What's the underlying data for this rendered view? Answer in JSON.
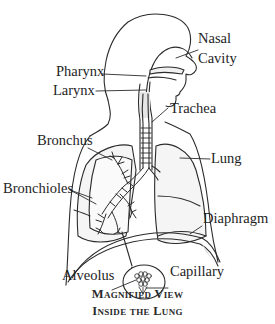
{
  "diagram": {
    "labels": {
      "nasal_cavity_line1": "Nasal",
      "nasal_cavity_line2": "Cavity",
      "pharynx": "Pharynx",
      "larynx": "Larynx",
      "trachea": "Trachea",
      "bronchus": "Bronchus",
      "lung": "Lung",
      "bronchioles": "Bronchioles",
      "diaphragm": "Diaphragm",
      "alveolus": "Alveolus",
      "capillary": "Capillary"
    },
    "caption": {
      "line1": "Magnified View",
      "line2": "Inside the Lung"
    },
    "colors": {
      "line": "#2b2b2b",
      "fill_shade": "#ececec",
      "background": "#ffffff"
    }
  }
}
